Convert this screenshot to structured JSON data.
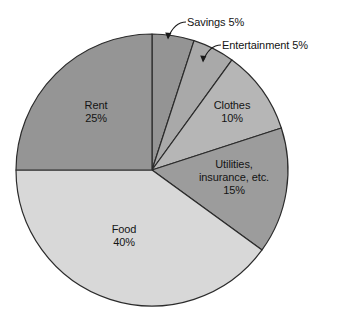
{
  "chart_data": {
    "type": "pie",
    "title": "",
    "subtitle": "",
    "xlabel": "",
    "ylabel": "",
    "grid": false,
    "legend_position": "none",
    "label_style": "inside-and-callout",
    "start_angle_deg": 0,
    "direction": "clockwise",
    "center": {
      "x": 152,
      "y": 170
    },
    "radius": 136,
    "categories": [
      "Savings",
      "Entertainment",
      "Clothes",
      "Utilities, insurance, etc.",
      "Food",
      "Rent"
    ],
    "values": [
      5,
      5,
      10,
      15,
      40,
      25
    ],
    "units": "percent",
    "total": 100,
    "slices": [
      {
        "name": "Savings",
        "label": "Savings",
        "value_label": "5%",
        "value": 5,
        "color": "#949494",
        "label_placement": "callout",
        "callout_text": "Savings 5%"
      },
      {
        "name": "Entertainment",
        "label": "Entertainment",
        "value_label": "5%",
        "value": 5,
        "color": "#a9a9a9",
        "label_placement": "callout",
        "callout_text": "Entertainment 5%"
      },
      {
        "name": "Clothes",
        "label": "Clothes",
        "value_label": "10%",
        "value": 10,
        "color": "#b6b6b6",
        "label_placement": "inside"
      },
      {
        "name": "Utilities, insurance, etc.",
        "label_line1": "Utilities,",
        "label_line2": "insurance, etc.",
        "value_label": "15%",
        "value": 15,
        "color": "#9c9c9c",
        "label_placement": "inside"
      },
      {
        "name": "Food",
        "label": "Food",
        "value_label": "40%",
        "value": 40,
        "color": "#d8d8d8",
        "label_placement": "inside"
      },
      {
        "name": "Rent",
        "label": "Rent",
        "value_label": "25%",
        "value": 25,
        "color": "#959595",
        "label_placement": "inside"
      }
    ],
    "stroke_color": "#2b2b2b",
    "background_color": "#ffffff"
  }
}
